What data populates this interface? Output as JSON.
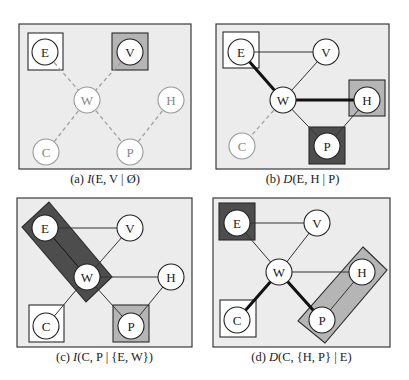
{
  "figure": {
    "colors": {
      "panel_bg": "#ececec",
      "panel_border": "#3a3a3a",
      "dark_fill": "#4d4d4d",
      "light_fill": "#b5b5b5",
      "white_fill": "#ffffff",
      "faded_stroke": "#9a9a9a",
      "edge_stroke": "#333333"
    },
    "panels": [
      {
        "id": "a",
        "caption_prefix": "(a) ",
        "caption_func": "I",
        "caption_args": "(E, V | Ø)",
        "caption_full": "(a) I(E, V | Ø)",
        "nodes": [
          {
            "label": "E",
            "state": "normal"
          },
          {
            "label": "V",
            "state": "normal"
          },
          {
            "label": "W",
            "state": "faded"
          },
          {
            "label": "H",
            "state": "faded"
          },
          {
            "label": "C",
            "state": "faded"
          },
          {
            "label": "P",
            "state": "faded"
          }
        ],
        "highlights": [
          {
            "nodes": [
              "E"
            ],
            "fill": "white"
          },
          {
            "nodes": [
              "V"
            ],
            "fill": "light"
          }
        ]
      },
      {
        "id": "b",
        "caption_prefix": "(b) ",
        "caption_func": "D",
        "caption_args": "(E, H | P)",
        "caption_full": "(b) D(E, H | P)",
        "nodes": [
          {
            "label": "E",
            "state": "normal"
          },
          {
            "label": "V",
            "state": "normal"
          },
          {
            "label": "W",
            "state": "normal"
          },
          {
            "label": "H",
            "state": "normal"
          },
          {
            "label": "C",
            "state": "faded"
          },
          {
            "label": "P",
            "state": "normal"
          }
        ],
        "highlights": [
          {
            "nodes": [
              "E"
            ],
            "fill": "white"
          },
          {
            "nodes": [
              "H"
            ],
            "fill": "light"
          },
          {
            "nodes": [
              "P"
            ],
            "fill": "dark"
          }
        ]
      },
      {
        "id": "c",
        "caption_prefix": "(c) ",
        "caption_func": "I",
        "caption_args": "(C, P | {E, W})",
        "caption_full": "(c) I(C, P | {E, W})",
        "nodes": [
          {
            "label": "E",
            "state": "normal"
          },
          {
            "label": "V",
            "state": "normal"
          },
          {
            "label": "W",
            "state": "normal"
          },
          {
            "label": "H",
            "state": "normal"
          },
          {
            "label": "C",
            "state": "normal"
          },
          {
            "label": "P",
            "state": "normal"
          }
        ],
        "highlights": [
          {
            "nodes": [
              "E",
              "W"
            ],
            "fill": "dark"
          },
          {
            "nodes": [
              "C"
            ],
            "fill": "white"
          },
          {
            "nodes": [
              "P"
            ],
            "fill": "light"
          }
        ]
      },
      {
        "id": "d",
        "caption_prefix": "(d) ",
        "caption_func": "D",
        "caption_args": "(C, {H, P} | E)",
        "caption_full": "(d) D(C, {H, P} | E)",
        "nodes": [
          {
            "label": "E",
            "state": "normal"
          },
          {
            "label": "V",
            "state": "normal"
          },
          {
            "label": "W",
            "state": "normal"
          },
          {
            "label": "H",
            "state": "normal"
          },
          {
            "label": "C",
            "state": "normal"
          },
          {
            "label": "P",
            "state": "normal"
          }
        ],
        "highlights": [
          {
            "nodes": [
              "E"
            ],
            "fill": "dark"
          },
          {
            "nodes": [
              "C"
            ],
            "fill": "white"
          },
          {
            "nodes": [
              "H",
              "P"
            ],
            "fill": "light"
          }
        ]
      }
    ],
    "edges": [
      [
        "E",
        "W"
      ],
      [
        "V",
        "W"
      ],
      [
        "W",
        "C"
      ],
      [
        "W",
        "P"
      ],
      [
        "H",
        "P"
      ],
      [
        "E",
        "V"
      ],
      [
        "W",
        "H"
      ]
    ]
  },
  "labels": {
    "E": "E",
    "V": "V",
    "W": "W",
    "H": "H",
    "C": "C",
    "P": "P"
  }
}
